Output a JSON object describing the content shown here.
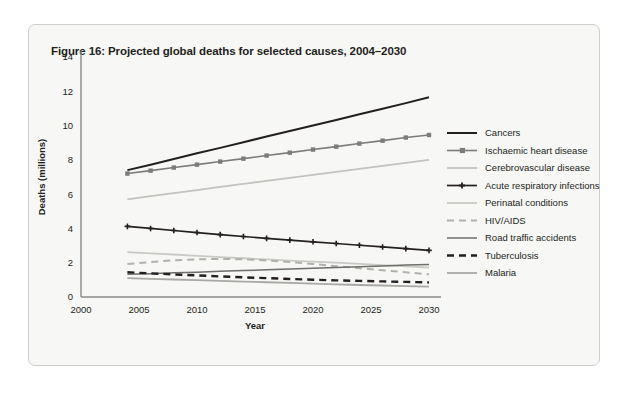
{
  "figure": {
    "title": "Figure 16: Projected global deaths for selected causes, 2004–2030"
  },
  "chart_data": {
    "type": "line",
    "title": "Figure 16: Projected global deaths for selected causes, 2004–2030",
    "xlabel": "Year",
    "ylabel": "Deaths (millions)",
    "xlim": [
      2000,
      2030
    ],
    "ylim": [
      0,
      14
    ],
    "xticks": [
      2000,
      2005,
      2010,
      2015,
      2020,
      2025,
      2030
    ],
    "yticks": [
      0,
      2,
      4,
      6,
      8,
      10,
      12,
      14
    ],
    "xtick_labels": [
      "2000",
      "2005",
      "2010",
      "2015",
      "2020",
      "2025",
      "2030"
    ],
    "ytick_labels": [
      "0",
      "2",
      "4",
      "6",
      "8",
      "10",
      "12",
      "14"
    ],
    "grid": false,
    "legend_position": "right",
    "x": [
      2004,
      2006,
      2008,
      2010,
      2012,
      2014,
      2016,
      2018,
      2020,
      2022,
      2024,
      2026,
      2028,
      2030
    ],
    "series": [
      {
        "name": "Cancers",
        "color": "#231f20",
        "width": 2.0,
        "dash": "none",
        "marker": "none",
        "values": [
          7.4,
          7.72,
          8.05,
          8.38,
          8.7,
          9.03,
          9.36,
          9.68,
          10.0,
          10.33,
          10.66,
          10.98,
          11.31,
          11.65
        ]
      },
      {
        "name": "Ischaemic heart disease",
        "color": "#7c7c7a",
        "width": 1.6,
        "dash": "none",
        "marker": "square",
        "values": [
          7.2,
          7.37,
          7.55,
          7.72,
          7.9,
          8.07,
          8.25,
          8.42,
          8.6,
          8.77,
          8.95,
          9.12,
          9.3,
          9.45
        ]
      },
      {
        "name": "Cerebrovascular disease",
        "color": "#c2c2be",
        "width": 1.8,
        "dash": "none",
        "marker": "none",
        "values": [
          5.7,
          5.88,
          6.06,
          6.24,
          6.42,
          6.6,
          6.77,
          6.95,
          7.12,
          7.3,
          7.47,
          7.65,
          7.82,
          8.0
        ]
      },
      {
        "name": "Acute respiratory infections",
        "color": "#231f20",
        "width": 1.7,
        "dash": "none",
        "marker": "plus",
        "values": [
          4.12,
          4.0,
          3.88,
          3.76,
          3.64,
          3.53,
          3.42,
          3.32,
          3.22,
          3.12,
          3.02,
          2.92,
          2.82,
          2.72
        ]
      },
      {
        "name": "Perinatal conditions",
        "color": "#c9c9c5",
        "width": 1.8,
        "dash": "none",
        "marker": "none",
        "values": [
          2.62,
          2.55,
          2.48,
          2.4,
          2.33,
          2.26,
          2.19,
          2.12,
          2.06,
          2.0,
          1.93,
          1.86,
          1.79,
          1.72
        ]
      },
      {
        "name": "HIV/AIDS",
        "color": "#b0b0ac",
        "width": 2.0,
        "dash": "dashed",
        "marker": "none",
        "values": [
          1.92,
          2.04,
          2.14,
          2.2,
          2.22,
          2.2,
          2.13,
          2.04,
          1.93,
          1.8,
          1.68,
          1.56,
          1.44,
          1.32
        ]
      },
      {
        "name": "Road traffic accidents",
        "color": "#6e6e6c",
        "width": 1.5,
        "dash": "none",
        "marker": "none",
        "values": [
          1.32,
          1.36,
          1.41,
          1.45,
          1.5,
          1.54,
          1.59,
          1.63,
          1.68,
          1.72,
          1.77,
          1.81,
          1.86,
          1.9
        ]
      },
      {
        "name": "Tuberculosis",
        "color": "#231f20",
        "width": 2.4,
        "dash": "dashed",
        "marker": "none",
        "values": [
          1.44,
          1.38,
          1.32,
          1.26,
          1.2,
          1.15,
          1.1,
          1.05,
          1.01,
          0.97,
          0.94,
          0.91,
          0.88,
          0.85
        ]
      },
      {
        "name": "Malaria",
        "color": "#a8a8a4",
        "width": 1.8,
        "dash": "none",
        "marker": "none",
        "values": [
          1.1,
          1.06,
          1.02,
          0.98,
          0.94,
          0.9,
          0.86,
          0.82,
          0.78,
          0.74,
          0.7,
          0.67,
          0.64,
          0.6
        ]
      }
    ]
  }
}
